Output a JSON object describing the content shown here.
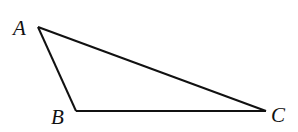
{
  "diagram": {
    "type": "triangle",
    "stroke_color": "#111111",
    "background": "#ffffff",
    "vertices": [
      {
        "name": "A",
        "x": 38,
        "y": 27,
        "label": "A",
        "label_x": 13,
        "label_y": 35
      },
      {
        "name": "B",
        "x": 76,
        "y": 111,
        "label": "B",
        "label_x": 51,
        "label_y": 124
      },
      {
        "name": "C",
        "x": 266,
        "y": 111,
        "label": "C",
        "label_x": 271,
        "label_y": 122
      }
    ],
    "edges": [
      {
        "from": "A",
        "to": "B"
      },
      {
        "from": "B",
        "to": "C"
      },
      {
        "from": "C",
        "to": "A"
      }
    ]
  }
}
